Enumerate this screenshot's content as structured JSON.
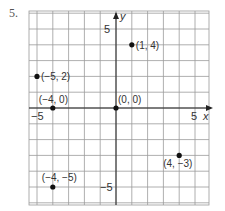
{
  "problem_number": "5.",
  "chart_data": {
    "type": "scatter",
    "title": "",
    "xlabel": "x",
    "ylabel": "y",
    "xlim": [
      -5.5,
      5.8
    ],
    "ylim": [
      -6,
      6
    ],
    "grid": true,
    "tick_labels": {
      "x": [
        {
          "value": -5,
          "label": "−5"
        },
        {
          "value": 5,
          "label": "5"
        }
      ],
      "y": [
        {
          "value": 5,
          "label": "5"
        },
        {
          "value": -5,
          "label": "−5"
        }
      ]
    },
    "points": [
      {
        "x": 1,
        "y": 4,
        "label": "(1, 4)"
      },
      {
        "x": -5,
        "y": 2,
        "label": "(−5, 2)"
      },
      {
        "x": -4,
        "y": 0,
        "label": "(−4, 0)"
      },
      {
        "x": 0,
        "y": 0,
        "label": "(0, 0)"
      },
      {
        "x": 4,
        "y": -3,
        "label": "(4, −3)"
      },
      {
        "x": -4,
        "y": -5,
        "label": "(−4, −5)"
      }
    ],
    "colors": {
      "grid": "#9a9a9a",
      "axis": "#222222",
      "point": "#111111"
    }
  }
}
